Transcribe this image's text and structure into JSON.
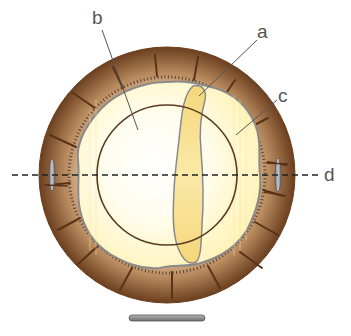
{
  "diagram": {
    "labels": [
      {
        "id": "a",
        "text": "a"
      },
      {
        "id": "b",
        "text": "b"
      },
      {
        "id": "c",
        "text": "c"
      },
      {
        "id": "d",
        "text": "d"
      }
    ],
    "colors": {
      "outer_ring_dark": "#6b3f1f",
      "outer_ring_light": "#c9a27a",
      "inner_fill": "#fff6c8",
      "inner_center": "#ffffff",
      "elongated_body": "#f7dc86",
      "outline_gray": "#8a8a8a",
      "circle_line": "#5a3a22",
      "dashed_line": "#222222",
      "label_text": "#555555",
      "bar": "#8c8c8c"
    }
  }
}
